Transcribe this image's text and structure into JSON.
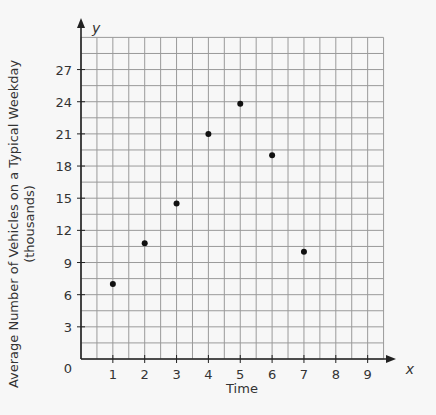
{
  "chart_data": {
    "type": "scatter",
    "title": "",
    "xlabel": "Time",
    "ylabel": "Average Number of Vehicles on a Typical Weekday",
    "ylabel_sub": "(thousands)",
    "x_axis_letter": "x",
    "y_axis_letter": "y",
    "origin_label": "0",
    "x_ticks": [
      1,
      2,
      3,
      4,
      5,
      6,
      7,
      8,
      9
    ],
    "y_ticks": [
      3,
      6,
      9,
      12,
      15,
      18,
      21,
      24,
      27
    ],
    "xlim": [
      0,
      9.5
    ],
    "ylim": [
      0,
      30
    ],
    "grid": true,
    "grid_minor": {
      "x_step": 0.5,
      "y_step": 1.5
    },
    "legend": null,
    "points": [
      {
        "x": 1,
        "y": 7
      },
      {
        "x": 2,
        "y": 10.8
      },
      {
        "x": 3,
        "y": 14.5
      },
      {
        "x": 4,
        "y": 21
      },
      {
        "x": 5,
        "y": 23.8
      },
      {
        "x": 6,
        "y": 19
      },
      {
        "x": 7,
        "y": 10
      }
    ],
    "colors": {
      "grid": "#9a9a9a",
      "axis": "#222222",
      "point": "#111111",
      "background": "#f7f7f7"
    }
  }
}
